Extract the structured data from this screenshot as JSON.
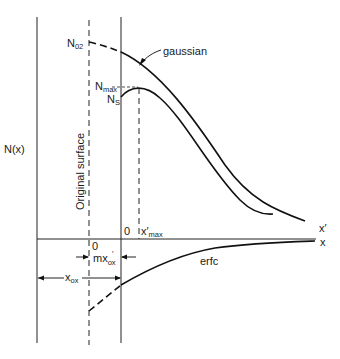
{
  "diagram": {
    "y_axis_label": "N(x)",
    "surface_label": "Original surface",
    "labels": {
      "n02": {
        "main": "N",
        "sub": "02"
      },
      "nmax": {
        "main": "N",
        "sub": "max"
      },
      "ns": {
        "main": "N",
        "sub": "S"
      },
      "gaussian": "gaussian",
      "erfc": "erfc",
      "x_prime": "x′",
      "x": "x",
      "origin_new": "0",
      "origin_old": "0",
      "x_prime_max": {
        "main": "x′",
        "sub": "max"
      },
      "m_x_ox": {
        "main": "mx",
        "sup": "′",
        "sub": "ox"
      },
      "x_ox": {
        "main": "x",
        "sub": "ox"
      }
    },
    "curves": [
      {
        "name": "gaussian",
        "style": "solid, dashed before new surface"
      },
      {
        "name": "redistributed profile",
        "style": "solid, peak N_max at x′_max"
      },
      {
        "name": "erfc",
        "style": "solid below axis, dashed before new surface"
      }
    ],
    "colors": {
      "ink": "#111111",
      "background": "#ffffff"
    }
  }
}
